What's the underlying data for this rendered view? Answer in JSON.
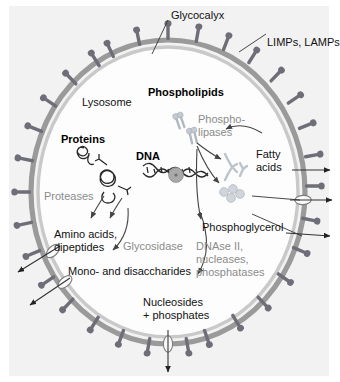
{
  "figure": {
    "background": "#f2f2f2",
    "membrane_color": "#9a9a9a",
    "glycocalyx_color": "#c9c9c9",
    "protein_color": "#6e6e78",
    "molecule_color": "#b9bfc6",
    "enzyme_label_color": "#8b8b8b",
    "substrate_label_color": "#111111"
  },
  "labels": {
    "glycocalyx": "Glycocalyx",
    "limps_lamps": "LIMPs, LAMPs",
    "lysosome": "Lysosome",
    "phospholipids": "Phospholipids",
    "proteins": "Proteins",
    "dna": "DNA",
    "phospholipases_line1": "Phospho-",
    "phospholipases_line2": "lipases",
    "proteases": "Proteases",
    "glycosidase": "Glycosidase",
    "dnase_line1": "DNAse II,",
    "dnase_line2": "nucleases,",
    "dnase_line3": "phosphatases",
    "fatty_acids_line1": "Fatty",
    "fatty_acids_line2": "acids",
    "phosphoglycerol": "Phosphoglycerol",
    "amino_acids_line1": "Amino acids,",
    "amino_acids_line2": "dipeptides",
    "mono_disaccharides": "Mono- and disaccharides",
    "nucleosides_line1": "Nucleosides",
    "nucleosides_line2": "+ phosphates"
  },
  "entities": {
    "substrates": [
      "Phospholipids",
      "Proteins",
      "DNA"
    ],
    "enzymes": [
      "Phospholipases",
      "Proteases",
      "Glycosidase",
      "DNAse II",
      "nucleases",
      "phosphatases"
    ],
    "products": [
      "Fatty acids",
      "Phosphoglycerol",
      "Amino acids, dipeptides",
      "Mono- and disaccharides",
      "Nucleosides + phosphates"
    ],
    "membrane_components": [
      "Glycocalyx",
      "LIMPs, LAMPs"
    ]
  }
}
